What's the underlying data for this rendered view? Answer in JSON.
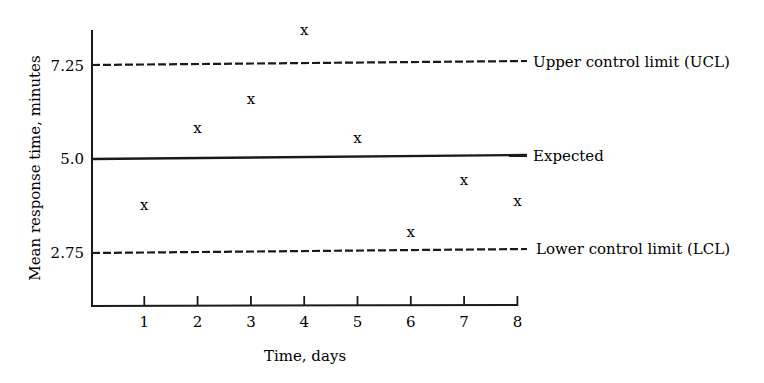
{
  "chart_data": {
    "type": "scatter",
    "title": "",
    "xlabel": "Time, days",
    "ylabel": "Mean response time, minutes",
    "x": [
      1,
      2,
      3,
      4,
      5,
      6,
      7,
      8
    ],
    "series": [
      {
        "name": "Daily mean response time",
        "marker": "x",
        "values": [
          3.9,
          5.75,
          6.45,
          8.1,
          5.5,
          3.25,
          4.5,
          4.0
        ]
      }
    ],
    "reference_lines": [
      {
        "name": "Upper control limit (UCL)",
        "value": 7.25,
        "style": "dashed"
      },
      {
        "name": "Expected",
        "value": 5.0,
        "style": "solid"
      },
      {
        "name": "Lower control limit (LCL)",
        "value": 2.75,
        "style": "dashed"
      }
    ],
    "x_ticks": [
      "1",
      "2",
      "3",
      "4",
      "5",
      "6",
      "7",
      "8"
    ],
    "y_ticks": [
      "2.75",
      "5.0",
      "7.25"
    ],
    "xlim": [
      0,
      8
    ],
    "ylim": [
      1.5,
      8.3
    ],
    "grid": false,
    "legend": "none (lines labeled directly at right)"
  },
  "labels": {
    "xlabel": "Time, days",
    "ylabel": "Mean response time, minutes",
    "ucl": "Upper control limit (UCL)",
    "expected": "Expected",
    "lcl": "Lower control limit (LCL)",
    "yt_ucl": "7.25",
    "yt_exp": "5.0",
    "yt_lcl": "2.75",
    "xt": [
      "1",
      "2",
      "3",
      "4",
      "5",
      "6",
      "7",
      "8"
    ],
    "marker": "x"
  }
}
